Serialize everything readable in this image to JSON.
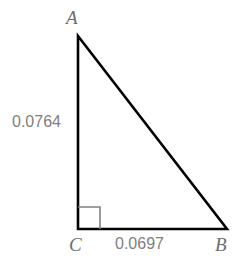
{
  "figure": {
    "type": "right-triangle-diagram",
    "background_color": "#ffffff",
    "stroke_color": "#000000",
    "label_color": "#808080",
    "right_angle_marker_color": "#808080"
  },
  "vertices": {
    "a": {
      "label": "A",
      "x": 78,
      "y": 36
    },
    "b": {
      "label": "B",
      "x": 227,
      "y": 229
    },
    "c": {
      "label": "C",
      "x": 78,
      "y": 229
    }
  },
  "measurements": {
    "vertical_leg": {
      "label": "0.0764",
      "side": "AC"
    },
    "horizontal_leg": {
      "label": "0.0697",
      "side": "CB"
    }
  },
  "right_angle": {
    "at_vertex": "C",
    "marker_size": 22
  }
}
